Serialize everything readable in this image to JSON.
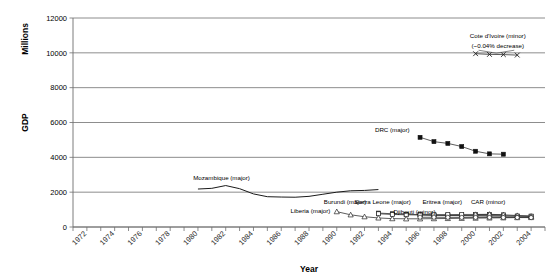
{
  "chart_data": {
    "type": "line",
    "title": "",
    "xlabel": "Year",
    "ylabel": "GDP",
    "ylabel_secondary": "Millions",
    "ylim": [
      0,
      12000
    ],
    "xlim": [
      1971,
      2005
    ],
    "ytick_labels": [
      "0",
      "2000",
      "4000",
      "6000",
      "8000",
      "10000",
      "12000"
    ],
    "ytick_values": [
      0,
      2000,
      4000,
      6000,
      8000,
      10000,
      12000
    ],
    "xtick_labels": [
      "1972",
      "1974",
      "1976",
      "1978",
      "1980",
      "1982",
      "1984",
      "1986",
      "1988",
      "1990",
      "1992",
      "1994",
      "1996",
      "1998",
      "2000",
      "2002",
      "2004"
    ],
    "xtick_values": [
      1972,
      1974,
      1976,
      1978,
      1980,
      1982,
      1984,
      1986,
      1988,
      1990,
      1992,
      1994,
      1996,
      1998,
      2000,
      2002,
      2004
    ],
    "grid": true,
    "legend_position": "inline-annotations",
    "annotations": [
      {
        "text": "Cote d'Ivoire (minor)",
        "x": 2001.6,
        "y": 10850
      },
      {
        "text": "(~0.04% decrease)",
        "x": 2001.6,
        "y": 10250
      }
    ],
    "series": [
      {
        "name": "Cote d'Ivoire (minor)",
        "label": "Cote d'Ivoire (minor)",
        "marker": "x",
        "x": [
          2000,
          2001,
          2002,
          2003
        ],
        "y": [
          9950,
          9910,
          9900,
          9870
        ]
      },
      {
        "name": "DRC (major)",
        "label": "DRC (major)",
        "marker": "square-filled",
        "x": [
          1996,
          1997,
          1998,
          1999,
          2000,
          2001,
          2002
        ],
        "y": [
          5150,
          4900,
          4800,
          4620,
          4350,
          4200,
          4180
        ]
      },
      {
        "name": "Mozambique (major)",
        "label": "Mozambique (major)",
        "marker": "none",
        "x": [
          1980,
          1981,
          1982,
          1983,
          1984,
          1985,
          1986,
          1987,
          1988,
          1989,
          1990,
          1991,
          1992,
          1993
        ],
        "y": [
          2180,
          2220,
          2380,
          2200,
          1900,
          1740,
          1720,
          1710,
          1760,
          1880,
          2000,
          2080,
          2100,
          2150
        ]
      },
      {
        "name": "Burundi (major)",
        "label": "Burundi (major)",
        "marker": "square-filled",
        "x": [
          1993,
          1994,
          1995,
          1996,
          1997,
          1998,
          1999,
          2000,
          2001,
          2002,
          2003,
          2004
        ],
        "y": [
          800,
          760,
          730,
          710,
          690,
          670,
          660,
          650,
          640,
          630,
          620,
          610
        ]
      },
      {
        "name": "Sierra Leone (major)",
        "label": "Sierra Leone (major)",
        "marker": "square-open",
        "x": [
          1993,
          1994,
          1995,
          1996,
          1997,
          1998,
          1999,
          2000,
          2001,
          2002,
          2003,
          2004
        ],
        "y": [
          760,
          720,
          700,
          690,
          670,
          660,
          650,
          645,
          640,
          635,
          630,
          625
        ]
      },
      {
        "name": "Eritrea (major)",
        "label": "Eritrea (major)",
        "marker": "square-open",
        "x": [
          1996,
          1997,
          1998,
          1999,
          2000,
          2001,
          2002
        ],
        "y": [
          700,
          700,
          710,
          720,
          720,
          715,
          700
        ]
      },
      {
        "name": "CAR (minor)",
        "label": "CAR (minor)",
        "marker": "triangle-open",
        "x": [
          2000,
          2001,
          2002,
          2003,
          2004
        ],
        "y": [
          720,
          730,
          700,
          660,
          620
        ]
      },
      {
        "name": "Liberia (major)",
        "label": "Liberia (major)",
        "marker": "triangle-open",
        "x": [
          1990,
          1991,
          1992,
          1993,
          1994,
          1995,
          1996,
          1997,
          1998,
          1999,
          2000,
          2001,
          2002,
          2003,
          2004
        ],
        "y": [
          880,
          700,
          590,
          520,
          480,
          470,
          470,
          480,
          490,
          500,
          510,
          520,
          530,
          540,
          545
        ]
      },
      {
        "name": "Djibouti (minor)",
        "label": "Djibouti (minor)",
        "marker": "circle-open",
        "x": [
          1996,
          1997,
          1998,
          1999,
          2000,
          2001,
          2002,
          2003,
          2004
        ],
        "y": [
          560,
          560,
          555,
          550,
          550,
          550,
          545,
          545,
          540
        ]
      }
    ],
    "series_labels": [
      {
        "text": "Mozambique (major)",
        "x": 1981.7,
        "y": 2700
      },
      {
        "text": "DRC (major)",
        "x": 1994.0,
        "y": 5450
      },
      {
        "text": "Burundi (major)",
        "x": 1990.6,
        "y": 1320
      },
      {
        "text": "Sierra Leone (major)",
        "x": 1993.3,
        "y": 1320
      },
      {
        "text": "Eritrea (major)",
        "x": 1997.6,
        "y": 1320
      },
      {
        "text": "CAR (minor)",
        "x": 2000.9,
        "y": 1320
      },
      {
        "text": "Liberia (major)",
        "x": 1988.1,
        "y": 790
      },
      {
        "text": "Djibouti (minor)",
        "x": 1995.6,
        "y": 760
      }
    ]
  }
}
